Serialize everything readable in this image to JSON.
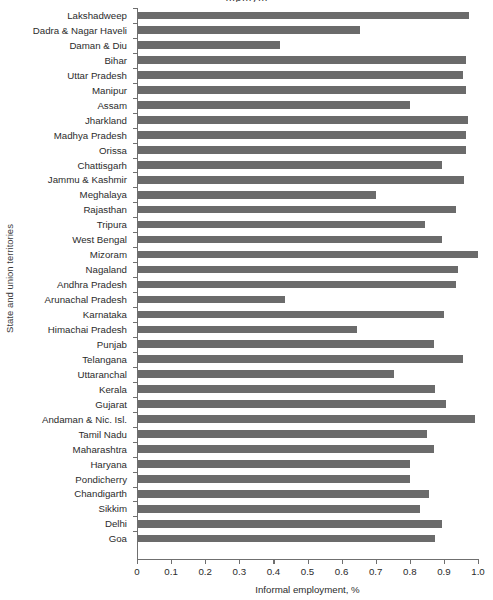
{
  "chart_data": {
    "type": "bar",
    "orientation": "horizontal",
    "title": "Informal employment, %",
    "title_fragment_visible": "…p…y…",
    "xlabel": "Informal employment, %",
    "ylabel": "State and union territories",
    "xlim": [
      0,
      1.0
    ],
    "grid": false,
    "legend": null,
    "bar_color": "#6b6b6b",
    "axis_color": "#6f6f6f",
    "xticks": [
      "0",
      "0.1",
      "0.2",
      "0.3",
      "0.4",
      "0.5",
      "0.6",
      "0.7",
      "0.8",
      "0.9",
      "1.0"
    ],
    "xtick_values": [
      0,
      0.1,
      0.2,
      0.3,
      0.4,
      0.5,
      0.6,
      0.7,
      0.8,
      0.9,
      1.0
    ],
    "categories": [
      "Lakshadweep",
      "Dadra & Nagar Haveli",
      "Daman & Diu",
      "Bihar",
      "Uttar Pradesh",
      "Manipur",
      "Assam",
      "Jharkland",
      "Madhya Pradesh",
      "Orissa",
      "Chattisgarh",
      "Jammu & Kashmir",
      "Meghalaya",
      "Rajasthan",
      "Tripura",
      "West Bengal",
      "Mizoram",
      "Nagaland",
      "Andhra Pradesh",
      "Arunachal Pradesh",
      "Karnataka",
      "Himachai Pradesh",
      "Punjab",
      "Telangana",
      "Uttaranchal",
      "Kerala",
      "Gujarat",
      "Andaman & Nic. Isl.",
      "Tamil Nadu",
      "Maharashtra",
      "Haryana",
      "Pondicherry",
      "Chandigarth",
      "Sikkim",
      "Delhi",
      "Goa"
    ],
    "values": [
      0.975,
      0.655,
      0.42,
      0.965,
      0.955,
      0.965,
      0.8,
      0.97,
      0.965,
      0.965,
      0.895,
      0.96,
      0.7,
      0.935,
      0.845,
      0.895,
      1.0,
      0.94,
      0.935,
      0.435,
      0.9,
      0.645,
      0.87,
      0.955,
      0.755,
      0.875,
      0.905,
      0.99,
      0.85,
      0.87,
      0.8,
      0.8,
      0.855,
      0.83,
      0.895,
      0.875
    ]
  }
}
